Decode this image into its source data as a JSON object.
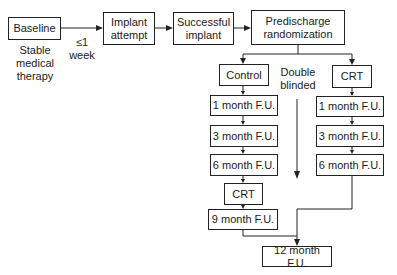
{
  "diagram": {
    "nodes": {
      "baseline": "Baseline",
      "implant_attempt_1": "Implant",
      "implant_attempt_2": "attempt",
      "successful_1": "Successful",
      "successful_2": "implant",
      "randomization_1": "Predischarge",
      "randomization_2": "randomization",
      "control": "Control",
      "crt": "CRT",
      "control_fu1": "1 month F.U.",
      "control_fu3": "3 month F.U.",
      "control_fu6": "6 month F.U.",
      "control_crt": "CRT",
      "control_fu9": "9 month F.U.",
      "crt_fu1": "1 month F.U.",
      "crt_fu3": "3 month F.U.",
      "crt_fu6": "6 month F.U.",
      "fu12": "12 month F.U."
    },
    "annotations": {
      "baseline_note_1": "Stable",
      "baseline_note_2": "medical",
      "baseline_note_3": "therapy",
      "interval_1": "≤1",
      "interval_2": "week",
      "blinded_1": "Double",
      "blinded_2": "blinded"
    },
    "edges": [
      [
        "Baseline",
        "Implant attempt"
      ],
      [
        "Implant attempt",
        "Successful implant"
      ],
      [
        "Successful implant",
        "Predischarge randomization"
      ],
      [
        "Predischarge randomization",
        "Control"
      ],
      [
        "Predischarge randomization",
        "CRT"
      ],
      [
        "Control",
        "1 month F.U."
      ],
      [
        "1 month F.U.",
        "3 month F.U."
      ],
      [
        "3 month F.U.",
        "6 month F.U."
      ],
      [
        "6 month F.U.",
        "CRT"
      ],
      [
        "CRT",
        "9 month F.U."
      ],
      [
        "9 month F.U.",
        "12 month F.U."
      ],
      [
        "CRT",
        "1 month F.U."
      ],
      [
        "6 month F.U.",
        "12 month F.U."
      ]
    ]
  }
}
